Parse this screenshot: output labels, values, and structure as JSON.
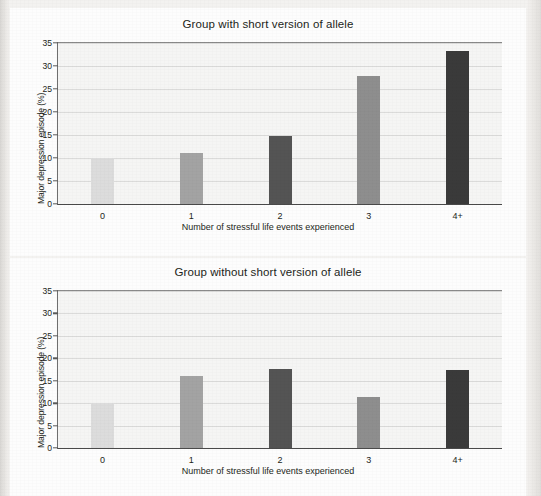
{
  "page": {
    "background_color": "#f3f2f0",
    "panel_color": "#fdfdfd"
  },
  "charts": [
    {
      "id": "top",
      "title": "Group with short version of allele",
      "xlabel": "Number of stressful life events experienced",
      "ylabel": "Major depression episode (%)"
    },
    {
      "id": "bottom",
      "title": "Group without short version of allele",
      "xlabel": "Number of stressful life events experienced",
      "ylabel": "Major depression episode (%)"
    }
  ],
  "chart_data": [
    {
      "type": "bar",
      "title": "Group with short version of allele",
      "xlabel": "Number of stressful life events experienced",
      "ylabel": "Major depression episode (%)",
      "categories": [
        "0",
        "1",
        "2",
        "3",
        "4+"
      ],
      "values": [
        10.0,
        11.0,
        14.7,
        27.8,
        33.3
      ],
      "bar_colors": [
        "#dcdcdc",
        "#a3a3a3",
        "#545454",
        "#8e8e8e",
        "#3a3a3a"
      ],
      "ylim": [
        0,
        35
      ],
      "yticks": [
        0,
        5,
        10,
        15,
        20,
        25,
        30,
        35
      ],
      "ytick_labels": [
        "0",
        "5",
        "10",
        "15",
        "20",
        "25",
        "30",
        "35"
      ],
      "grid": true,
      "legend": null
    },
    {
      "type": "bar",
      "title": "Group without short version of allele",
      "xlabel": "Number of stressful life events experienced",
      "ylabel": "Major depression episode (%)",
      "categories": [
        "0",
        "1",
        "2",
        "3",
        "4+"
      ],
      "values": [
        10.0,
        16.1,
        17.7,
        11.3,
        17.4
      ],
      "bar_colors": [
        "#dcdcdc",
        "#a3a3a3",
        "#545454",
        "#8e8e8e",
        "#3a3a3a"
      ],
      "ylim": [
        0,
        35
      ],
      "yticks": [
        0,
        5,
        10,
        15,
        20,
        25,
        30,
        35
      ],
      "ytick_labels": [
        "0",
        "5",
        "10",
        "15",
        "20",
        "25",
        "30",
        "35"
      ],
      "grid": true,
      "legend": null
    }
  ]
}
